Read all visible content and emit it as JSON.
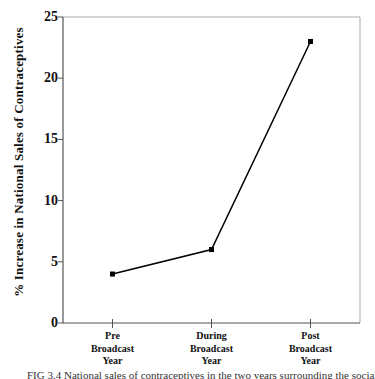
{
  "figure": {
    "caption": "FIG 3.4  National sales of contraceptives in the two years surrounding the social"
  },
  "chart_data": {
    "type": "line",
    "title": "",
    "xlabel": "",
    "ylabel": "% Increase in National Sales of Contraceptives",
    "categories": [
      "Pre\nBroadcast\nYear",
      "During\nBroadcast\nYear",
      "Post\nBroadcast\nYear"
    ],
    "values": [
      4,
      6,
      23
    ],
    "ylim": [
      0,
      25
    ],
    "yticks": [
      25,
      20,
      15,
      10,
      5,
      0
    ],
    "grid": false,
    "legend": "none",
    "marker": "filled-square",
    "line_color": "#000000",
    "axis_color": "#555555",
    "frame_color": "#a9a9a9",
    "text_color": "#111111"
  }
}
